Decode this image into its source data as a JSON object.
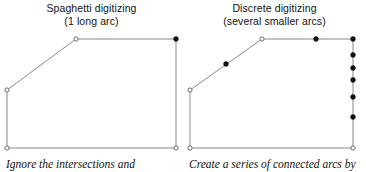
{
  "figure": {
    "width": 366,
    "height": 172,
    "background": "#ffffff",
    "line_color": "#8a8a8a",
    "vertex_fill_color": "#111111",
    "vertex_open_color": "#ffffff",
    "vertex_stroke_color": "#6b6b6b"
  },
  "panels": [
    {
      "id": "spaghetti",
      "title_line1": "Spaghetti digitizing",
      "title_line2": "(1 long arc)",
      "caption": "Ignore the intersections and",
      "polyline_points": "7,90 76,39 176,39 176,148 7,148 7,90",
      "open_vertices": [
        {
          "name": "vertex-arc-start-left",
          "x": 7,
          "y": 90
        },
        {
          "name": "vertex-arc-bend-top",
          "x": 76,
          "y": 39
        },
        {
          "name": "vertex-arc-corner-bottom-left",
          "x": 7,
          "y": 148
        },
        {
          "name": "vertex-arc-corner-bottom-right",
          "x": 176,
          "y": 148
        }
      ],
      "filled_vertices": [
        {
          "name": "vertex-arc-node-top-right",
          "x": 176,
          "y": 39
        }
      ]
    },
    {
      "id": "discrete",
      "title_line1": "Discrete digitizing",
      "title_line2": "(several smaller arcs)",
      "caption": "Create a series of connected arcs by",
      "polyline_points": "7,90 79,39 170,39 170,148 7,148 7,90",
      "open_vertices": [
        {
          "name": "vertex-arc-start-left",
          "x": 7,
          "y": 90
        },
        {
          "name": "vertex-arc-bend-top",
          "x": 79,
          "y": 39
        },
        {
          "name": "vertex-arc-corner-bottom-left",
          "x": 7,
          "y": 148
        },
        {
          "name": "vertex-arc-corner-bottom-right",
          "x": 170,
          "y": 148
        }
      ],
      "filled_vertices": [
        {
          "name": "vertex-node-diagonal-mid",
          "x": 43,
          "y": 64
        },
        {
          "name": "vertex-node-top-mid",
          "x": 133,
          "y": 39
        },
        {
          "name": "vertex-node-top-right-corner",
          "x": 170,
          "y": 39
        },
        {
          "name": "vertex-node-right-1",
          "x": 170,
          "y": 55
        },
        {
          "name": "vertex-node-right-2",
          "x": 170,
          "y": 68
        },
        {
          "name": "vertex-node-right-3",
          "x": 170,
          "y": 80
        },
        {
          "name": "vertex-node-right-4",
          "x": 170,
          "y": 97
        },
        {
          "name": "vertex-node-right-5",
          "x": 170,
          "y": 117
        }
      ]
    }
  ]
}
